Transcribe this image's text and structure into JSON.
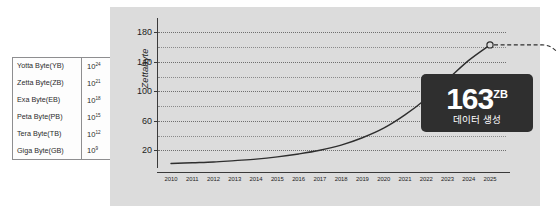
{
  "units_table": {
    "rows": [
      {
        "name": "Yotta Byte(YB)",
        "base": "10",
        "exp": "24"
      },
      {
        "name": "Zetta Byte(ZB)",
        "base": "10",
        "exp": "21"
      },
      {
        "name": "Exa Byte(EB)",
        "base": "10",
        "exp": "18"
      },
      {
        "name": "Peta Byte(PB)",
        "base": "10",
        "exp": "15"
      },
      {
        "name": "Tera Byte(TB)",
        "base": "10",
        "exp": "12"
      },
      {
        "name": "Giga Byte(GB)",
        "base": "10",
        "exp": "9"
      }
    ]
  },
  "callout": {
    "value": "163",
    "unit": "ZB",
    "caption": "데이터 생성"
  },
  "colors": {
    "panel_background": "#dcdcdc",
    "page_background": "#ffffff",
    "curve": "#2e2e2e",
    "gridline": "#8a8a8a",
    "axis": "#3a3a3a",
    "callout_background": "#2f2f2f",
    "callout_text": "#ffffff",
    "table_border": "#8e8e90"
  },
  "chart_data": {
    "type": "line",
    "title": "",
    "subtitle": "",
    "xlabel": "",
    "ylabel": "Zettabyte",
    "x": [
      2010,
      2011,
      2012,
      2013,
      2014,
      2015,
      2016,
      2017,
      2018,
      2019,
      2020,
      2021,
      2022,
      2023,
      2024,
      2025
    ],
    "tick_labels_x": [
      "2010",
      "2011",
      "2012",
      "2013",
      "2014",
      "2015",
      "2016",
      "2017",
      "2018",
      "2019",
      "2020",
      "2021",
      "2022",
      "2023",
      "2024",
      "2025"
    ],
    "series": [
      {
        "name": "Global data created",
        "values": [
          2,
          3,
          4,
          6,
          8,
          11,
          15,
          20,
          27,
          37,
          50,
          68,
          90,
          116,
          142,
          163
        ]
      }
    ],
    "ylim": [
      0,
      190
    ],
    "xlim": [
      2010,
      2025
    ],
    "tick_labels_y": [
      "20",
      "60",
      "100",
      "140",
      "180"
    ],
    "ticks_y_major": [
      20,
      60,
      100,
      140,
      180
    ],
    "ticks_y_minor": [
      40,
      80,
      120,
      160
    ],
    "grid": true,
    "grid_style": "dotted-horizontal",
    "legend_position": "none",
    "annotations": [
      {
        "type": "marker",
        "shape": "open-circle",
        "x": 2025,
        "y": 163,
        "label": "163 ZB",
        "leader": "dashed-curve-to-callout"
      }
    ]
  }
}
